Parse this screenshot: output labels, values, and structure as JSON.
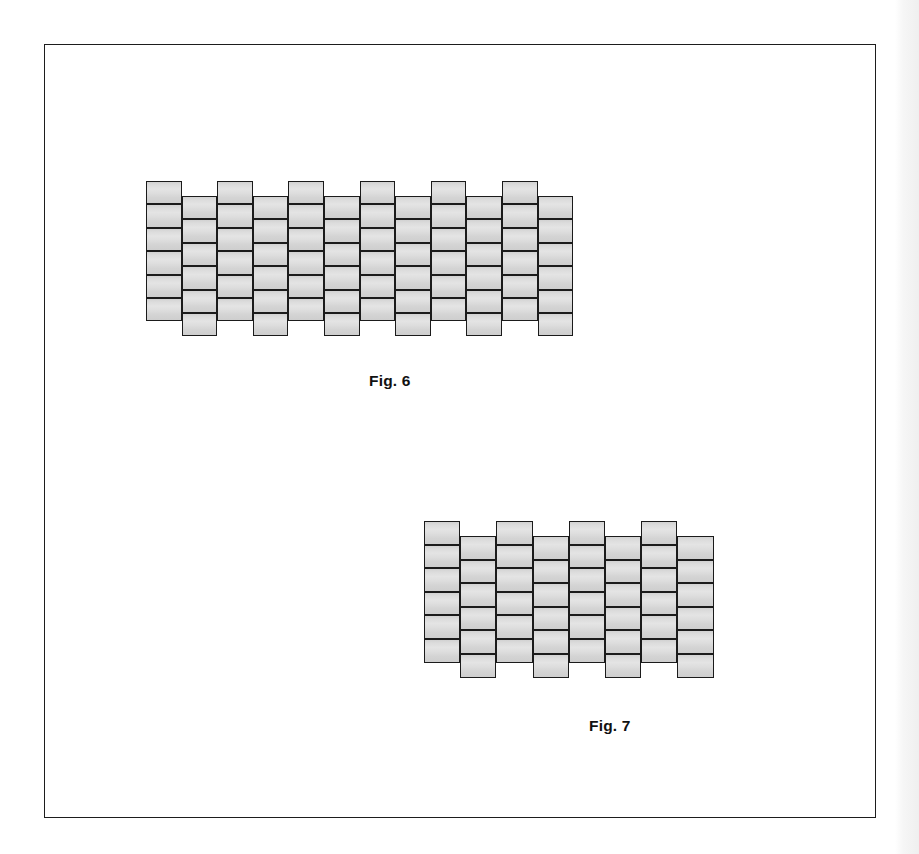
{
  "document": {
    "background_color": "#ffffff",
    "frame": {
      "border_color": "#1d1d1d",
      "x": 44,
      "y": 44,
      "width": 832,
      "height": 774
    },
    "edge_shade_color": "#efefef"
  },
  "style": {
    "brick_fill_color": "#dcdcdc",
    "brick_stroke_color": "#1b1b1b",
    "caption_color": "#111111"
  },
  "figures": [
    {
      "id": "fig-6",
      "caption": "Fig. 6",
      "caption_x": 368,
      "caption_y": 371,
      "description": "staggered interlocking block weave pattern, wide",
      "origin_x": 145,
      "origin_y": 180,
      "columns": 12,
      "rows": 6,
      "brick_width": 35.6,
      "brick_height": 23.4,
      "column_pitch": 35.6,
      "row_pitch": 23.4,
      "stagger_offset": 15.0,
      "column_phases": [
        1,
        0,
        1,
        0,
        1,
        0,
        1,
        0,
        1,
        0,
        1,
        0
      ]
    },
    {
      "id": "fig-7",
      "caption": "Fig. 7",
      "caption_x": 588,
      "caption_y": 716,
      "description": "staggered interlocking block weave pattern, narrow",
      "origin_x": 423,
      "origin_y": 520,
      "columns": 8,
      "rows": 6,
      "brick_width": 36.2,
      "brick_height": 23.6,
      "column_pitch": 36.2,
      "row_pitch": 23.6,
      "stagger_offset": 15.0,
      "column_phases": [
        1,
        0,
        1,
        0,
        1,
        0,
        1,
        0
      ]
    }
  ]
}
